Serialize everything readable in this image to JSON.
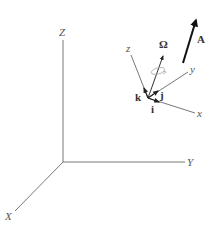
{
  "diagram": {
    "type": "3d-coordinate-frames",
    "fixed_frame": {
      "origin": [
        63,
        162
      ],
      "axes": [
        {
          "name": "Z",
          "label": "Z",
          "end": [
            63,
            40
          ],
          "label_pos": [
            59,
            36
          ]
        },
        {
          "name": "Y",
          "label": "Y",
          "end": [
            185,
            162
          ],
          "label_pos": [
            187,
            166
          ]
        },
        {
          "name": "X",
          "label": "X",
          "end": [
            15,
            211
          ],
          "label_pos": [
            5,
            220
          ]
        }
      ]
    },
    "rotating_frame": {
      "origin": [
        148,
        98
      ],
      "axes": [
        {
          "name": "z",
          "label": "z",
          "end": [
            131,
            55
          ],
          "label_pos": [
            126,
            52
          ]
        },
        {
          "name": "y",
          "label": "y",
          "end": [
            188,
            72
          ],
          "label_pos": [
            190,
            73
          ]
        },
        {
          "name": "x",
          "label": "x",
          "end": [
            195,
            113
          ],
          "label_pos": [
            197,
            117
          ]
        }
      ],
      "unit_vectors": [
        {
          "name": "i",
          "label": "i",
          "tip": [
            159,
            103
          ],
          "label_pos": [
            151,
            113
          ]
        },
        {
          "name": "j",
          "label": "j",
          "tip": [
            158,
            91
          ],
          "label_pos": [
            160,
            99
          ]
        },
        {
          "name": "k",
          "label": "k",
          "tip": [
            144,
            88
          ],
          "label_pos": [
            135,
            101
          ]
        }
      ],
      "angular_velocity": {
        "label": "Ω",
        "tip": [
          163,
          55
        ],
        "label_pos": [
          159,
          48
        ]
      }
    },
    "vector_A": {
      "label": "A",
      "start": [
        183,
        63
      ],
      "tip": [
        197,
        17
      ],
      "label_pos": [
        197,
        43
      ]
    },
    "colors": {
      "axis": "#777777",
      "vector": "#222222",
      "rotation": "#aaaaaa"
    }
  }
}
